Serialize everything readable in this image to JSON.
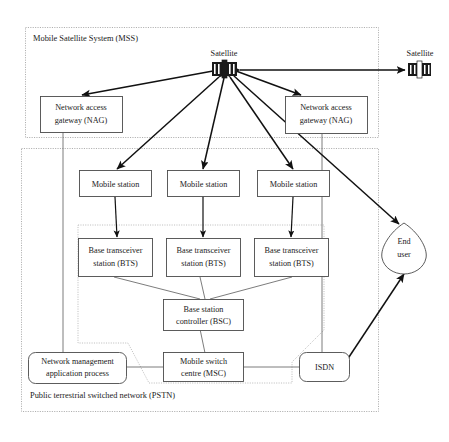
{
  "figure": {
    "type": "network-architecture-diagram"
  },
  "zones": [
    {
      "id": "mss",
      "label": "Mobile Satellite System (MSS)",
      "style": "dotted-rect"
    },
    {
      "id": "pstn",
      "label": "Public terrestrial switched network (PSTN)",
      "style": "dotted-rect"
    },
    {
      "id": "gsm",
      "label": "GSM cellular",
      "style": "dotted-polygon"
    }
  ],
  "nodes": [
    {
      "id": "satellite-main",
      "label": "Satellite",
      "shape": "satellite-icon",
      "caption_position": "above"
    },
    {
      "id": "satellite-right",
      "label": "Satellite",
      "shape": "satellite-icon",
      "caption_position": "above"
    },
    {
      "id": "nag-left",
      "label": "Network access\ngateway (NAG)",
      "line1": "Network access",
      "line2": "gateway (NAG)",
      "shape": "rect"
    },
    {
      "id": "nag-right",
      "label": "Network access\ngateway (NAG)",
      "line1": "Network access",
      "line2": "gateway (NAG)",
      "shape": "rect"
    },
    {
      "id": "ms-1",
      "label": "Mobile station",
      "shape": "rect"
    },
    {
      "id": "ms-2",
      "label": "Mobile station",
      "shape": "rect"
    },
    {
      "id": "ms-3",
      "label": "Mobile station",
      "shape": "rect"
    },
    {
      "id": "bts-1",
      "line1": "Base transceiver",
      "line2": "station (BTS)",
      "label": "Base transceiver station (BTS)",
      "shape": "rect"
    },
    {
      "id": "bts-2",
      "line1": "Base transceiver",
      "line2": "station (BTS)",
      "label": "Base transceiver station (BTS)",
      "shape": "rect"
    },
    {
      "id": "bts-3",
      "line1": "Base transceiver",
      "line2": "station (BTS)",
      "label": "Base transceiver station (BTS)",
      "shape": "rect"
    },
    {
      "id": "bsc",
      "line1": "Base station",
      "line2": "controller (BSC)",
      "label": "Base station controller (BSC)",
      "shape": "rect"
    },
    {
      "id": "msc",
      "line1": "Mobile switch",
      "line2": "centre (MSC)",
      "label": "Mobile switch centre (MSC)",
      "shape": "rect"
    },
    {
      "id": "nmap",
      "line1": "Network management",
      "line2": "application process",
      "label": "Network management application process",
      "shape": "rounded-rect"
    },
    {
      "id": "isdn",
      "label": "ISDN",
      "shape": "rounded-rect"
    },
    {
      "id": "end-user",
      "line1": "End",
      "line2": "user",
      "label": "End user",
      "shape": "teardrop"
    }
  ],
  "edges": [
    {
      "from": "satellite-main",
      "to": "nag-left",
      "arrow": "both"
    },
    {
      "from": "satellite-main",
      "to": "nag-right",
      "arrow": "both"
    },
    {
      "from": "satellite-main",
      "to": "satellite-right",
      "arrow": "both"
    },
    {
      "from": "satellite-main",
      "to": "ms-1",
      "arrow": "both"
    },
    {
      "from": "satellite-main",
      "to": "ms-2",
      "arrow": "both"
    },
    {
      "from": "satellite-main",
      "to": "ms-3",
      "arrow": "both"
    },
    {
      "from": "satellite-main",
      "to": "end-user",
      "arrow": "both"
    },
    {
      "from": "ms-1",
      "to": "bts-1",
      "arrow": "both"
    },
    {
      "from": "ms-2",
      "to": "bts-2",
      "arrow": "both"
    },
    {
      "from": "ms-3",
      "to": "bts-3",
      "arrow": "both"
    },
    {
      "from": "bts-1",
      "to": "bsc",
      "arrow": "none"
    },
    {
      "from": "bts-2",
      "to": "bsc",
      "arrow": "none"
    },
    {
      "from": "bts-3",
      "to": "bsc",
      "arrow": "none"
    },
    {
      "from": "bsc",
      "to": "msc",
      "arrow": "none"
    },
    {
      "from": "nmap",
      "to": "msc",
      "arrow": "none"
    },
    {
      "from": "msc",
      "to": "isdn",
      "arrow": "none"
    },
    {
      "from": "isdn",
      "to": "end-user",
      "arrow": "both"
    },
    {
      "from": "nag-left",
      "to": "nmap",
      "arrow": "none"
    },
    {
      "from": "nag-right",
      "to": "isdn",
      "arrow": "none"
    }
  ],
  "colors": {
    "background": "#ffffff",
    "node_stroke": "#4a4a4a",
    "zone_stroke": "#9a9a9a",
    "link": "#5a5a5a",
    "arrow": "#111111",
    "text": "#1a1a1a"
  }
}
